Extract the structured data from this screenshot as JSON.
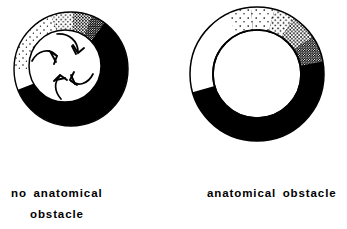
{
  "figure": {
    "background_color": "#ffffff",
    "ink_color": "#000000",
    "width": 347,
    "height": 229
  },
  "panels": [
    {
      "id": "left",
      "caption_line1": "no  anatomical",
      "caption_line2": "obstacle",
      "caption_full": "no anatomical obstacle",
      "diagram_name": "leading-circle-reentry-ring",
      "outer_circle": {
        "cx": 71,
        "cy": 69,
        "r": 57
      },
      "inner_circle": {
        "cx": 65,
        "cy": 66,
        "r": 36
      },
      "regions": [
        {
          "name": "depolarized-black-region",
          "fill": "solid-black",
          "description": "thick black crescent occupying the right and lower portion of the annulus"
        },
        {
          "name": "stippled-transition-region",
          "fill": "stipple-gradient",
          "description": "dotted region in the upper-left of the annulus, density increasing toward upper-right where it meets solid black"
        },
        {
          "name": "excitable-gap-white-region",
          "fill": "white",
          "description": "unshaded leading edge at the left of the annulus"
        }
      ],
      "arrows": [
        {
          "name": "center-arrow-upper",
          "direction": "clockwise-inward",
          "angle_deg": 75
        },
        {
          "name": "center-arrow-left",
          "direction": "clockwise-inward",
          "angle_deg": 195
        },
        {
          "name": "center-arrow-lower",
          "direction": "clockwise-inward",
          "angle_deg": 315
        }
      ],
      "arrow_count": 3
    },
    {
      "id": "right",
      "caption_line1": "anatomical  obstacle",
      "caption_line2": "",
      "caption_full": "anatomical obstacle",
      "diagram_name": "anatomical-obstacle-reentry-ring",
      "outer_circle": {
        "cx": 257,
        "cy": 74,
        "r": 67
      },
      "inner_circle": {
        "cx": 257,
        "cy": 74,
        "r": 44
      },
      "regions": [
        {
          "name": "depolarized-black-region",
          "fill": "solid-black",
          "description": "broad black band sweeping from the lower-left around the bottom and up the right side"
        },
        {
          "name": "stippled-transition-region",
          "fill": "stipple-gradient",
          "description": "dotted band across the top of the annulus, sparse at the left and dense at the upper-right where it merges into solid black"
        },
        {
          "name": "excitable-gap-white-region",
          "fill": "white",
          "description": "open white wedge of the annulus at the upper-left, bounded below by a sharp diagonal wavefront"
        }
      ],
      "arrows": [],
      "arrow_count": 0,
      "obstacle": {
        "name": "central-anatomical-obstacle",
        "description": "large white central hole representing the anatomical obstacle"
      }
    }
  ]
}
